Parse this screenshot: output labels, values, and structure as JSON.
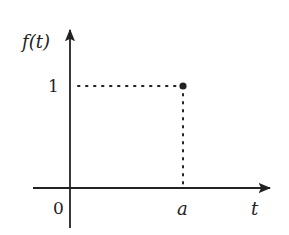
{
  "diagram": {
    "type": "function-plot",
    "colors": {
      "ink": "#222222",
      "background": "#ffffff"
    },
    "y_axis": {
      "label": "f(t)",
      "tick_labels": [
        "1"
      ]
    },
    "x_axis": {
      "label": "t",
      "tick_labels": [
        "a"
      ]
    },
    "origin_label": "0",
    "point": {
      "x_label": "a",
      "y_value": "1",
      "style": "filled-dot"
    },
    "guides": {
      "horizontal": "dotted line from y-axis at 1 to point",
      "vertical": "dotted line from point down to x-axis at a"
    }
  }
}
